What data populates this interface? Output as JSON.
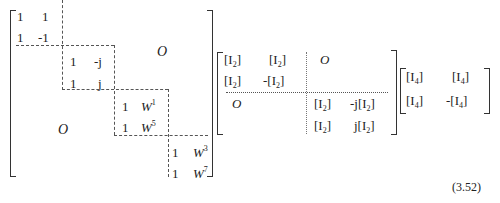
{
  "equation_number": "(3.52)",
  "matrix1": {
    "blocks": [
      {
        "rows": [
          [
            "1",
            "1"
          ],
          [
            "1",
            "-1"
          ]
        ]
      },
      {
        "rows": [
          [
            "1",
            "-j"
          ],
          [
            "1",
            "j"
          ]
        ]
      },
      {
        "rows": [
          [
            "1",
            "W",
            "1"
          ],
          [
            "1",
            "W",
            "5"
          ]
        ]
      },
      {
        "rows": [
          [
            "1",
            "W",
            "3"
          ],
          [
            "1",
            "W",
            "7"
          ]
        ]
      }
    ],
    "zero_upper": "O",
    "zero_lower": "O"
  },
  "matrix2": {
    "r1": [
      "[I",
      "2",
      "]",
      "[I",
      "2",
      "]"
    ],
    "r2": [
      "[I",
      "2",
      "]",
      "-[I",
      "2",
      "]"
    ],
    "r3": [
      "[I",
      "2",
      "]",
      "-j[I",
      "2",
      "]"
    ],
    "r4": [
      "[I",
      "2",
      "]",
      "j[I",
      "2",
      "]"
    ],
    "zero_upper": "O",
    "zero_lower": "O"
  },
  "matrix3": {
    "r1": [
      "[I",
      "4",
      "]",
      "[I",
      "4",
      "]"
    ],
    "r2": [
      "[I",
      "4",
      "]",
      "-[I",
      "4",
      "]"
    ]
  }
}
